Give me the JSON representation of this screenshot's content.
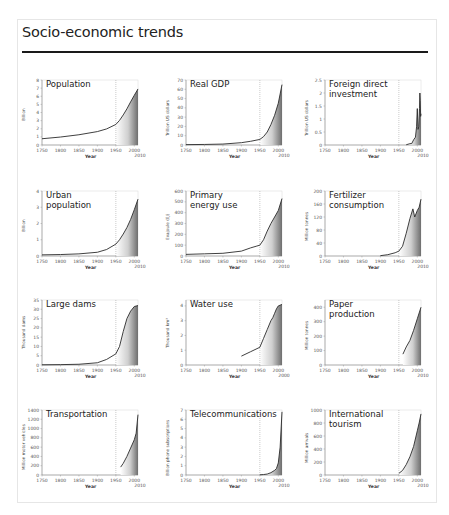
{
  "page": {
    "title": "Socio-economic trends"
  },
  "chart_data": [
    {
      "type": "area",
      "title": "Population",
      "xlabel": "Year",
      "ylabel": "Billion",
      "xticks": [
        "1750",
        "1800",
        "1850",
        "1900",
        "1950",
        "2000"
      ],
      "xend_label": "2010",
      "yticks": [
        "0",
        "1",
        "2",
        "3",
        "4",
        "5",
        "6",
        "7",
        "8"
      ],
      "ylim": [
        0,
        8
      ],
      "xlim": [
        1750,
        2010
      ],
      "marker_year": 1950,
      "x": [
        1750,
        1800,
        1850,
        1900,
        1925,
        1950,
        1960,
        1970,
        1980,
        1990,
        2000,
        2010
      ],
      "values": [
        0.77,
        0.98,
        1.26,
        1.65,
        1.98,
        2.53,
        3.03,
        3.7,
        4.45,
        5.31,
        6.12,
        6.9
      ]
    },
    {
      "type": "area",
      "title": "Real GDP",
      "xlabel": "Year",
      "ylabel": "Trillion US dollars",
      "xticks": [
        "1750",
        "1800",
        "1850",
        "1900",
        "1950",
        "2000"
      ],
      "xend_label": "2010",
      "yticks": [
        "0",
        "10",
        "20",
        "30",
        "40",
        "50",
        "60",
        "70"
      ],
      "ylim": [
        0,
        70
      ],
      "xlim": [
        1750,
        2010
      ],
      "marker_year": 1950,
      "x": [
        1750,
        1800,
        1850,
        1900,
        1925,
        1950,
        1960,
        1970,
        1980,
        1990,
        2000,
        2010
      ],
      "values": [
        0.4,
        0.6,
        1.0,
        2.5,
        4,
        6,
        9,
        14,
        22,
        32,
        45,
        65
      ]
    },
    {
      "type": "area",
      "title": "Foreign direct\ninvestment",
      "xlabel": "Year",
      "ylabel": "Trillion US dollars",
      "xticks": [
        "1750",
        "1800",
        "1850",
        "1900",
        "1950",
        "2000"
      ],
      "xend_label": "2010",
      "yticks": [
        "0",
        "0.5",
        "1",
        "1.5",
        "2",
        "2.5"
      ],
      "ylim": [
        0,
        2.5
      ],
      "xlim": [
        1750,
        2010
      ],
      "marker_year": 1950,
      "x": [
        1970,
        1980,
        1985,
        1990,
        1995,
        1998,
        2000,
        2002,
        2004,
        2006,
        2007,
        2008,
        2009,
        2010
      ],
      "values": [
        0.01,
        0.05,
        0.06,
        0.2,
        0.3,
        0.7,
        1.4,
        0.6,
        0.7,
        1.4,
        2.0,
        1.7,
        1.1,
        1.2
      ]
    },
    {
      "type": "area",
      "title": "Urban\npopulation",
      "xlabel": "Year",
      "ylabel": "Billion",
      "xticks": [
        "1750",
        "1800",
        "1850",
        "1900",
        "1950",
        "2000"
      ],
      "xend_label": "2010",
      "yticks": [
        "0",
        "1",
        "2",
        "3",
        "4"
      ],
      "ylim": [
        0,
        4
      ],
      "xlim": [
        1750,
        2010
      ],
      "marker_year": 1950,
      "x": [
        1750,
        1800,
        1850,
        1900,
        1925,
        1950,
        1960,
        1970,
        1980,
        1990,
        2000,
        2010
      ],
      "values": [
        0.07,
        0.09,
        0.13,
        0.23,
        0.4,
        0.73,
        1.0,
        1.35,
        1.75,
        2.25,
        2.85,
        3.5
      ]
    },
    {
      "type": "area",
      "title": "Primary\nenergy use",
      "xlabel": "Year",
      "ylabel": "Exajoule (EJ)",
      "xticks": [
        "1750",
        "1800",
        "1850",
        "1900",
        "1950",
        "2000"
      ],
      "xend_label": "2010",
      "yticks": [
        "0",
        "100",
        "200",
        "300",
        "400",
        "500",
        "600"
      ],
      "ylim": [
        0,
        600
      ],
      "xlim": [
        1750,
        2010
      ],
      "marker_year": 1950,
      "x": [
        1750,
        1800,
        1850,
        1900,
        1925,
        1940,
        1950,
        1960,
        1970,
        1980,
        1990,
        2000,
        2010
      ],
      "values": [
        15,
        20,
        25,
        45,
        75,
        90,
        100,
        150,
        230,
        300,
        360,
        420,
        530
      ]
    },
    {
      "type": "area",
      "title": "Fertilizer\nconsumption",
      "xlabel": "Year",
      "ylabel": "Million tonnes",
      "xticks": [
        "1750",
        "1800",
        "1850",
        "1900",
        "1950",
        "2000"
      ],
      "xend_label": "2010",
      "yticks": [
        "0",
        "40",
        "80",
        "120",
        "160",
        "200"
      ],
      "ylim": [
        0,
        200
      ],
      "xlim": [
        1750,
        2010
      ],
      "marker_year": 1950,
      "x": [
        1900,
        1920,
        1940,
        1950,
        1960,
        1970,
        1980,
        1988,
        1993,
        2000,
        2005,
        2010
      ],
      "values": [
        1,
        4,
        10,
        15,
        30,
        70,
        115,
        145,
        120,
        140,
        150,
        175
      ]
    },
    {
      "type": "area",
      "title": "Large dams",
      "xlabel": "Year",
      "ylabel": "Thousand dams",
      "xticks": [
        "1750",
        "1800",
        "1850",
        "1900",
        "1950",
        "2000"
      ],
      "xend_label": "2010",
      "yticks": [
        "0",
        "5",
        "10",
        "15",
        "20",
        "25",
        "30",
        "35"
      ],
      "ylim": [
        0,
        35
      ],
      "xlim": [
        1750,
        2010
      ],
      "marker_year": 1950,
      "x": [
        1750,
        1800,
        1850,
        1900,
        1925,
        1950,
        1960,
        1970,
        1980,
        1990,
        2000,
        2010
      ],
      "values": [
        0.1,
        0.2,
        0.4,
        1.2,
        3,
        6,
        10,
        18,
        25,
        29,
        31.5,
        32
      ]
    },
    {
      "type": "area",
      "title": "Water use",
      "xlabel": "Year",
      "ylabel": "Thousand km³",
      "xticks": [
        "1750",
        "1800",
        "1850",
        "1900",
        "1950",
        "2000"
      ],
      "xend_label": "2000",
      "yticks": [
        "0",
        "1",
        "2",
        "3",
        "4"
      ],
      "ylim": [
        0,
        4.4
      ],
      "xlim": [
        1750,
        2010
      ],
      "marker_year": 1950,
      "x": [
        1900,
        1925,
        1950,
        1960,
        1970,
        1980,
        1985,
        1990,
        1995,
        2000,
        2010
      ],
      "values": [
        0.6,
        0.9,
        1.2,
        1.8,
        2.4,
        3.0,
        3.2,
        3.5,
        3.8,
        4.0,
        4.1
      ]
    },
    {
      "type": "area",
      "title": "Paper\nproduction",
      "xlabel": "Year",
      "ylabel": "Million tonnes",
      "xticks": [
        "1750",
        "1800",
        "1850",
        "1900",
        "1950",
        "2000"
      ],
      "xend_label": "2010",
      "yticks": [
        "0",
        "100",
        "200",
        "300",
        "400"
      ],
      "ylim": [
        0,
        450
      ],
      "xlim": [
        1750,
        2010
      ],
      "marker_year": 1950,
      "x": [
        1961,
        1970,
        1980,
        1990,
        2000,
        2010
      ],
      "values": [
        75,
        125,
        170,
        240,
        320,
        400
      ]
    },
    {
      "type": "area",
      "title": "Transportation",
      "xlabel": "Year",
      "ylabel": "Million motor vehicles",
      "xticks": [
        "1750",
        "1800",
        "1850",
        "1900",
        "1950",
        "2000"
      ],
      "xend_label": "2010",
      "yticks": [
        "0",
        "200",
        "400",
        "600",
        "800",
        "1000",
        "1200",
        "1400"
      ],
      "ylim": [
        0,
        1400
      ],
      "xlim": [
        1750,
        2010
      ],
      "marker_year": 1950,
      "x": [
        1963,
        1970,
        1980,
        1990,
        2000,
        2005,
        2010
      ],
      "values": [
        170,
        250,
        400,
        580,
        760,
        900,
        1300
      ]
    },
    {
      "type": "area",
      "title": "Telecommunications",
      "xlabel": "Year",
      "ylabel": "Billion phone subscriptions",
      "xticks": [
        "1750",
        "1800",
        "1850",
        "1900",
        "1950",
        "2000"
      ],
      "xend_label": "2010",
      "yticks": [
        "0",
        "1",
        "2",
        "3",
        "4",
        "5",
        "6",
        "7"
      ],
      "ylim": [
        0,
        7
      ],
      "xlim": [
        1750,
        2010
      ],
      "marker_year": 1950,
      "x": [
        1950,
        1960,
        1970,
        1980,
        1990,
        1995,
        2000,
        2005,
        2010
      ],
      "values": [
        0.02,
        0.05,
        0.1,
        0.25,
        0.5,
        0.7,
        1.3,
        3.0,
        6.8
      ]
    },
    {
      "type": "area",
      "title": "International\ntourism",
      "xlabel": "Year",
      "ylabel": "Million arrivals",
      "xticks": [
        "1750",
        "1800",
        "1850",
        "1900",
        "1950",
        "2000"
      ],
      "xend_label": "2010",
      "yticks": [
        "0",
        "200",
        "400",
        "600",
        "800",
        "1000"
      ],
      "ylim": [
        0,
        1000
      ],
      "xlim": [
        1750,
        2010
      ],
      "marker_year": 1950,
      "x": [
        1950,
        1960,
        1970,
        1980,
        1990,
        2000,
        2005,
        2010
      ],
      "values": [
        25,
        70,
        160,
        280,
        440,
        680,
        800,
        940
      ]
    }
  ]
}
